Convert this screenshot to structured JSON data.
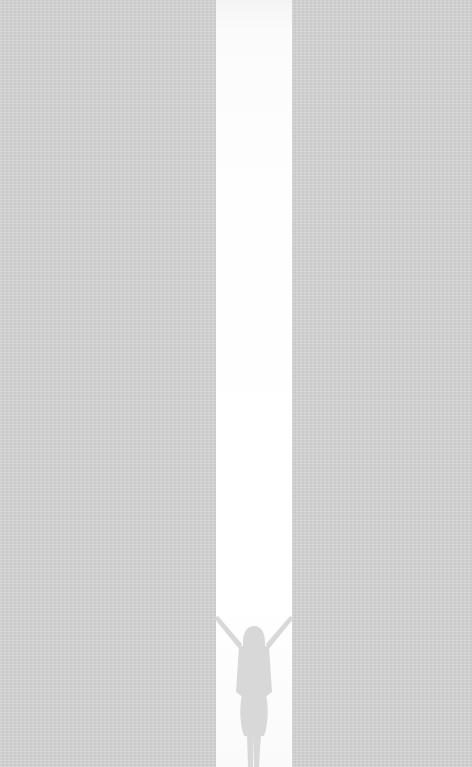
{
  "image": {
    "description": "Minimalist artwork: gray paper-textured background with a tall vertical white strip; a gray silhouette of a woman with arms raised stands at the bottom of the strip.",
    "colors": {
      "background": "#d5d5d5",
      "strip": "#ffffff",
      "silhouette": "#d9d9d9"
    },
    "subject": "woman-silhouette-arms-raised"
  }
}
